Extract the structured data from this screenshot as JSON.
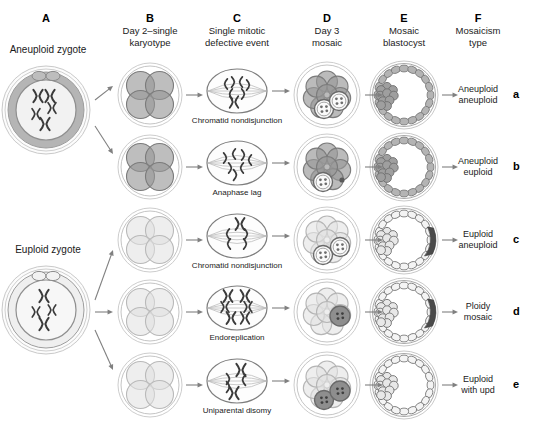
{
  "columns": [
    {
      "letter": "A",
      "caption": ""
    },
    {
      "letter": "B",
      "caption": "Day 2–single\nkaryotype"
    },
    {
      "letter": "C",
      "caption": "Single mitotic\ndefective event"
    },
    {
      "letter": "D",
      "caption": "Day 3\nmosaic"
    },
    {
      "letter": "E",
      "caption": "Mosaic\nblastocyst"
    },
    {
      "letter": "F",
      "caption": "Mosaicism\ntype"
    }
  ],
  "zygotes": [
    {
      "label": "Aneuploid zygote",
      "chromosomes": 5,
      "shade": "dark"
    },
    {
      "label": "Euploid zygote",
      "chromosomes": 4,
      "shade": "light"
    }
  ],
  "rows": [
    {
      "id": "a",
      "letter": "a",
      "event": "Chromatid nondisjunction",
      "type": "Aneuploid\naneuploid",
      "embryo_shade": "dark",
      "abnormal_cells": 2,
      "blastocyst": "dark"
    },
    {
      "id": "b",
      "letter": "b",
      "event": "Anaphase lag",
      "type": "Aneuploid\neuploid",
      "embryo_shade": "dark",
      "abnormal_cells": 2,
      "blastocyst": "dark"
    },
    {
      "id": "c",
      "letter": "c",
      "event": "Chromatid nondisjunction",
      "type": "Euploid\naneuploid",
      "embryo_shade": "light",
      "abnormal_cells": 2,
      "blastocyst": "light"
    },
    {
      "id": "d",
      "letter": "d",
      "event": "Endoreplication",
      "type": "Ploidy\nmosaic",
      "embryo_shade": "light",
      "abnormal_cells": 1,
      "blastocyst": "light"
    },
    {
      "id": "e",
      "letter": "e",
      "event": "Uniparental disomy",
      "type": "Euploid\nwith upd",
      "embryo_shade": "light",
      "abnormal_cells": 2,
      "blastocyst": "light"
    }
  ],
  "colors": {
    "dark_cell": "#9a9a9a",
    "light_cell": "#e2e2e2",
    "outline": "#6f6f6f",
    "zona_dark": "#b5b5b5",
    "chromosome": "#3a3a3a",
    "text": "#222222",
    "arrow": "#808080"
  }
}
